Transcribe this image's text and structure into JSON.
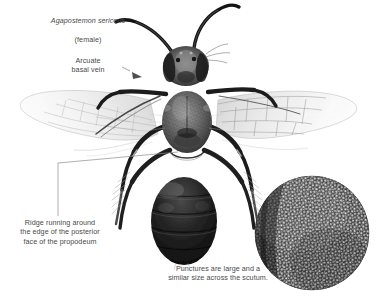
{
  "plate": {
    "subject": "bee-specimen-dorsal-view",
    "background_color": "#ffffff",
    "width": 384,
    "height": 296
  },
  "title": {
    "species": "Agapostemon sericeus",
    "sex": "(female)"
  },
  "annotations": [
    {
      "id": "arcuate-basal-vein",
      "text": "Arcuate\nbasal vein",
      "pointer": "arrow",
      "target": "left-forewing-basal-vein"
    },
    {
      "id": "propodeum-ridge",
      "text": "Ridge running around\nthe edge of the posterior\nface of the propodeum",
      "pointer": "elbow-leader-line",
      "target": "propodeum"
    },
    {
      "id": "scutum-punctures",
      "text": "Punctures are large and a\nsimilar size across the scutum.",
      "pointer": "none",
      "target": "scutum-detail-inset"
    }
  ],
  "inset": {
    "name": "scutum-puncture-detail",
    "shape": "circle",
    "description": "magnified dense puncture texture of the scutum"
  },
  "specimen_parts": [
    "antenna-left",
    "antenna-right",
    "head",
    "compound-eye-left",
    "compound-eye-right",
    "scutum",
    "thorax",
    "propodeum",
    "abdomen",
    "forewing-left",
    "forewing-right",
    "legs"
  ],
  "colors": {
    "background": "#ffffff",
    "label_text": "#4a4a4a",
    "leader_line": "#8d8d8d",
    "body_dark": "#1a1a1a",
    "body_mid": "#5c5c5c",
    "wing_vein": "#a8a8a8"
  }
}
